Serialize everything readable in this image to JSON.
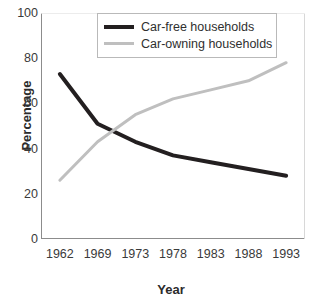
{
  "chart_data": {
    "type": "line",
    "title": "",
    "xlabel": "Year",
    "ylabel": "Percentage",
    "categories": [
      "1962",
      "1969",
      "1973",
      "1978",
      "1983",
      "1988",
      "1993"
    ],
    "ylim": [
      0,
      100
    ],
    "yticks": [
      0,
      20,
      40,
      60,
      80,
      100
    ],
    "ytick_labels": [
      "0",
      "20",
      "40",
      "60",
      "80",
      "100"
    ],
    "grid": false,
    "legend_position": "top-center",
    "series": [
      {
        "name": "Car-free households",
        "color": "#231f20",
        "width": 4,
        "values": [
          73,
          51,
          43,
          37,
          34,
          31,
          28
        ]
      },
      {
        "name": "Car-owning households",
        "color": "#bfbfbf",
        "width": 3,
        "values": [
          26,
          43,
          55,
          62,
          66,
          70,
          78
        ]
      }
    ]
  },
  "axes": {
    "y_title": "Percentage",
    "x_title": "Year"
  },
  "legend": {
    "items": [
      {
        "label": "Car-free households",
        "color": "#231f20"
      },
      {
        "label": "Car-owning households",
        "color": "#bfbfbf"
      }
    ]
  }
}
